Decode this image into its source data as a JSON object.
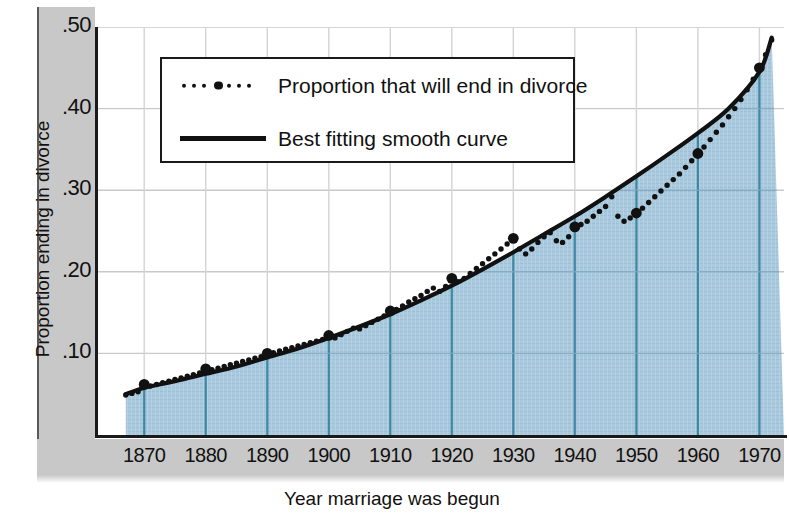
{
  "chart_data": {
    "type": "line",
    "title": "",
    "xlabel": "Year marriage was begun",
    "ylabel": "Proportion ending in divorce",
    "xlim": [
      1862,
      1974
    ],
    "ylim": [
      0.0,
      0.5
    ],
    "xticks": [
      1870,
      1880,
      1890,
      1900,
      1910,
      1920,
      1930,
      1940,
      1950,
      1960,
      1970
    ],
    "yticks": [
      0.1,
      0.2,
      0.3,
      0.4,
      0.5
    ],
    "ytick_labels": [
      ".10",
      ".20",
      ".30",
      ".40",
      ".50"
    ],
    "grid": true,
    "legend_position": "upper-left-inside",
    "series": [
      {
        "name": "Proportion that will end in divorce",
        "style": "dotted-markers",
        "color": "#111111",
        "x": [
          1867,
          1868,
          1869,
          1870,
          1871,
          1872,
          1873,
          1874,
          1875,
          1876,
          1877,
          1878,
          1879,
          1880,
          1881,
          1882,
          1883,
          1884,
          1885,
          1886,
          1887,
          1888,
          1889,
          1890,
          1891,
          1892,
          1893,
          1894,
          1895,
          1896,
          1897,
          1898,
          1899,
          1900,
          1901,
          1902,
          1903,
          1904,
          1905,
          1906,
          1907,
          1908,
          1909,
          1910,
          1911,
          1912,
          1913,
          1914,
          1915,
          1916,
          1917,
          1918,
          1919,
          1920,
          1921,
          1922,
          1923,
          1924,
          1925,
          1926,
          1927,
          1928,
          1929,
          1930,
          1931,
          1932,
          1933,
          1934,
          1935,
          1936,
          1937,
          1938,
          1939,
          1940,
          1941,
          1942,
          1943,
          1944,
          1945,
          1946,
          1947,
          1948,
          1949,
          1950,
          1951,
          1952,
          1953,
          1954,
          1955,
          1956,
          1957,
          1958,
          1959,
          1960,
          1961,
          1962,
          1963,
          1964,
          1965,
          1966,
          1967,
          1968,
          1969,
          1970,
          1971,
          1972
        ],
        "y": [
          0.049,
          0.051,
          0.053,
          0.062,
          0.06,
          0.062,
          0.064,
          0.066,
          0.068,
          0.07,
          0.072,
          0.074,
          0.076,
          0.081,
          0.08,
          0.082,
          0.084,
          0.086,
          0.088,
          0.09,
          0.092,
          0.094,
          0.096,
          0.1,
          0.101,
          0.103,
          0.105,
          0.107,
          0.109,
          0.111,
          0.113,
          0.115,
          0.117,
          0.122,
          0.119,
          0.123,
          0.127,
          0.131,
          0.13,
          0.134,
          0.138,
          0.142,
          0.146,
          0.152,
          0.154,
          0.158,
          0.163,
          0.167,
          0.171,
          0.176,
          0.18,
          0.176,
          0.182,
          0.192,
          0.188,
          0.192,
          0.198,
          0.204,
          0.21,
          0.216,
          0.222,
          0.228,
          0.234,
          0.241,
          0.228,
          0.222,
          0.228,
          0.236,
          0.243,
          0.248,
          0.238,
          0.236,
          0.243,
          0.255,
          0.258,
          0.262,
          0.268,
          0.274,
          0.28,
          0.292,
          0.268,
          0.262,
          0.266,
          0.272,
          0.278,
          0.285,
          0.292,
          0.299,
          0.306,
          0.313,
          0.32,
          0.328,
          0.336,
          0.345,
          0.353,
          0.362,
          0.371,
          0.38,
          0.39,
          0.4,
          0.411,
          0.423,
          0.436,
          0.45,
          0.466,
          0.484
        ],
        "highlight_x": [
          1870,
          1880,
          1890,
          1900,
          1910,
          1920,
          1930,
          1940,
          1950,
          1960,
          1970
        ],
        "highlight_note": "Larger filled markers at each decade year"
      },
      {
        "name": "Best fitting smooth curve",
        "style": "solid-line",
        "color": "#111111",
        "x": [
          1867,
          1870,
          1875,
          1880,
          1885,
          1890,
          1895,
          1900,
          1905,
          1910,
          1915,
          1920,
          1925,
          1930,
          1935,
          1940,
          1945,
          1950,
          1955,
          1960,
          1965,
          1970,
          1972
        ],
        "y": [
          0.05,
          0.058,
          0.066,
          0.075,
          0.084,
          0.095,
          0.106,
          0.119,
          0.133,
          0.148,
          0.165,
          0.183,
          0.203,
          0.224,
          0.246,
          0.268,
          0.292,
          0.317,
          0.343,
          0.37,
          0.4,
          0.445,
          0.487
        ]
      }
    ],
    "area_fill": {
      "color": "#a9c9dc",
      "description": "Region beneath the smooth curve filled with light blue texture"
    },
    "annotations": []
  },
  "axes": {
    "y_title": "Proportion ending in divorce",
    "x_title": "Year marriage was begun",
    "y_ticks": [
      {
        "label": ".50",
        "value": 0.5
      },
      {
        "label": ".40",
        "value": 0.4
      },
      {
        "label": ".30",
        "value": 0.3
      },
      {
        "label": ".20",
        "value": 0.2
      },
      {
        "label": ".10",
        "value": 0.1
      }
    ],
    "x_ticks": [
      {
        "label": "1870",
        "value": 1870
      },
      {
        "label": "1880",
        "value": 1880
      },
      {
        "label": "1890",
        "value": 1890
      },
      {
        "label": "1900",
        "value": 1900
      },
      {
        "label": "1910",
        "value": 1910
      },
      {
        "label": "1920",
        "value": 1920
      },
      {
        "label": "1930",
        "value": 1930
      },
      {
        "label": "1940",
        "value": 1940
      },
      {
        "label": "1950",
        "value": 1950
      },
      {
        "label": "1960",
        "value": 1960
      },
      {
        "label": "1970",
        "value": 1970
      }
    ]
  },
  "legend": {
    "entries": [
      {
        "key": "dots",
        "label": "Proportion that will end in divorce"
      },
      {
        "key": "line",
        "label": "Best fitting smooth curve"
      }
    ]
  },
  "colors": {
    "area_fill": "#a9c9dc",
    "area_gridline": "#2d7d9a",
    "plot_gridline": "#c9c9c9",
    "ink": "#111111",
    "page_grey": "#c8c8c8"
  }
}
